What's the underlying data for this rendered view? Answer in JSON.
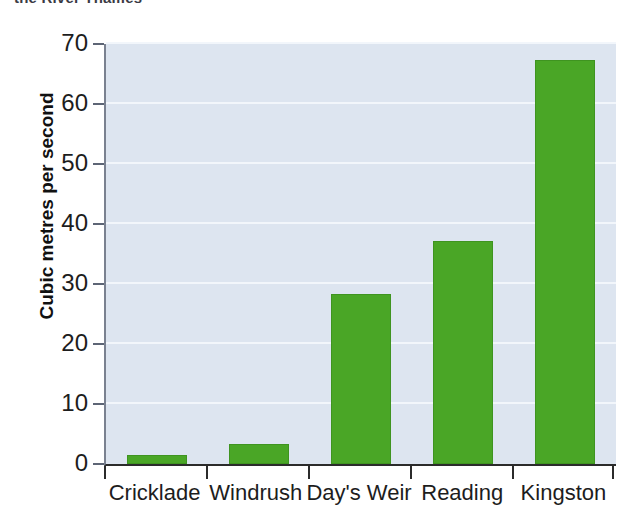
{
  "caption": "the River Thames",
  "chart_data": {
    "type": "bar",
    "title": "",
    "xlabel": "",
    "ylabel": "Cubic metres per second",
    "categories": [
      "Cricklade",
      "Windrush",
      "Day's Weir",
      "Reading",
      "Kingston"
    ],
    "values": [
      1.5,
      3.3,
      28.4,
      37.2,
      67.3
    ],
    "ylim": [
      0,
      70
    ],
    "yticks": [
      0,
      10,
      20,
      30,
      40,
      50,
      60,
      70
    ],
    "ytick_labels": [
      "0",
      "10",
      "20",
      "30",
      "40",
      "50",
      "60",
      "70"
    ],
    "grid": true,
    "legend": false,
    "colors": {
      "bar": "#4aa626",
      "bar_edge": "#3f9420",
      "plot_background": "#dde5f0",
      "gridline": "#f2f6fb",
      "axis": "#2b2b2b",
      "text": "#1d1d1d"
    }
  }
}
